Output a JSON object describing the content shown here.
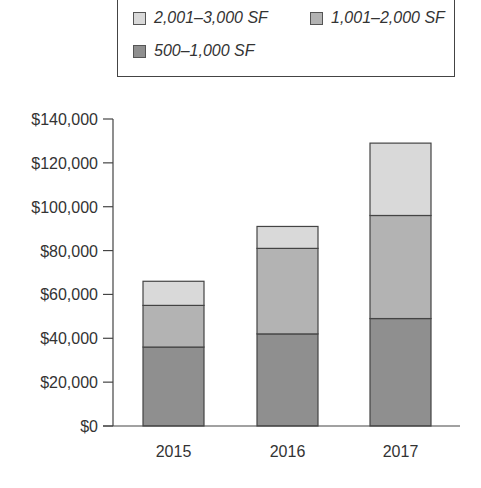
{
  "legend": {
    "items": [
      {
        "label": "2,001–3,000 SF",
        "color": "#d9d9d9"
      },
      {
        "label": "1,001–2,000 SF",
        "color": "#b3b3b3"
      },
      {
        "label": "500–1,000 SF",
        "color": "#8f8f8f"
      }
    ]
  },
  "axis": {
    "y_ticks": [
      "$0",
      "$20,000",
      "$40,000",
      "$60,000",
      "$80,000",
      "$100,000",
      "$120,000",
      "$140,000"
    ],
    "x_ticks": [
      "2015",
      "2016",
      "2017"
    ]
  },
  "chart_data": {
    "type": "bar",
    "stacked": true,
    "title": "",
    "xlabel": "",
    "ylabel": "",
    "categories": [
      "2015",
      "2016",
      "2017"
    ],
    "series": [
      {
        "name": "500–1,000 SF",
        "values": [
          36000,
          42000,
          49000
        ],
        "color": "#8f8f8f"
      },
      {
        "name": "1,001–2,000 SF",
        "values": [
          19000,
          39000,
          47000
        ],
        "color": "#b3b3b3"
      },
      {
        "name": "2,001–3,000 SF",
        "values": [
          11000,
          10000,
          33000
        ],
        "color": "#d9d9d9"
      }
    ],
    "totals": [
      66000,
      91000,
      129000
    ],
    "ylim": [
      0,
      140000
    ],
    "y_tick_step": 20000,
    "grid": false,
    "legend_position": "top"
  }
}
